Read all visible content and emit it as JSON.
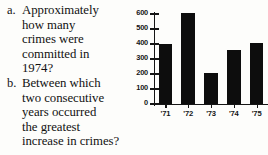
{
  "questions": [
    {
      "marker": "a.",
      "lines": [
        "Approximately",
        "how many",
        "crimes were",
        "committed in",
        "1974?"
      ]
    },
    {
      "marker": "b.",
      "lines": [
        "Between which",
        "two consecutive",
        "years occurred",
        "the greatest",
        "increase in crimes?"
      ]
    }
  ],
  "chart_data": {
    "type": "bar",
    "title": "",
    "xlabel": "",
    "ylabel": "",
    "categories": [
      "'71",
      "'72",
      "'73",
      "'74",
      "'75"
    ],
    "values": [
      400,
      610,
      205,
      360,
      410
    ],
    "ylim": [
      0,
      600
    ],
    "yticks": [
      0,
      100,
      200,
      300,
      400,
      500,
      600
    ],
    "ytick_labels": [
      "0",
      "100",
      "200",
      "300",
      "400",
      "500",
      "600"
    ],
    "grid": false,
    "legend": "none",
    "bar_color": "#0d0d0d"
  }
}
